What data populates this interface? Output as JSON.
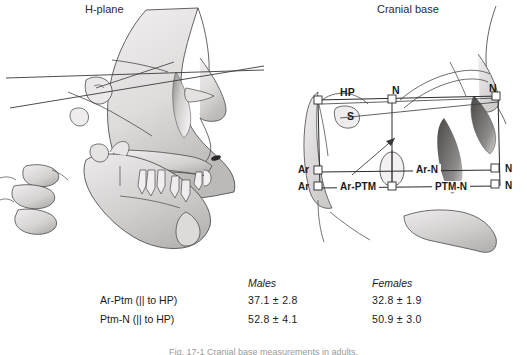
{
  "figure": {
    "panels": [
      {
        "id": "h-plane",
        "title": "H-plane"
      },
      {
        "id": "cranial-base",
        "title": "Cranial base"
      }
    ],
    "caption": "Fig. 17-1  Cranial base measurements in adults."
  },
  "cranial_base_labels": {
    "hp": "HP",
    "n_top_left": "N",
    "n_top_right": "N",
    "s": "S",
    "ar_upper": "Ar",
    "ar_lower": "Ar",
    "ar_n": "Ar-N",
    "ar_ptm": "Ar-PTM",
    "ptm_n": "PTM-N",
    "n_right_upper": "N",
    "n_right_lower": "N"
  },
  "measurements_table": {
    "columns": [
      "",
      "Males",
      "Females"
    ],
    "rows": [
      {
        "label": "Ar-Ptm (|| to HP)",
        "males": "37.1 ± 2.8",
        "females": "32.8 ± 1.9"
      },
      {
        "label": "Ptm-N (|| to HP)",
        "males": "52.8 ± 4.1",
        "females": "50.9 ± 3.0"
      }
    ]
  },
  "colors": {
    "ink": "#1a1a1a",
    "bone_light": "#eceaea",
    "bone_mid": "#cfcccc",
    "bone_dark": "#9b9898",
    "line": "#3a3a3a",
    "background": "#ffffff"
  }
}
